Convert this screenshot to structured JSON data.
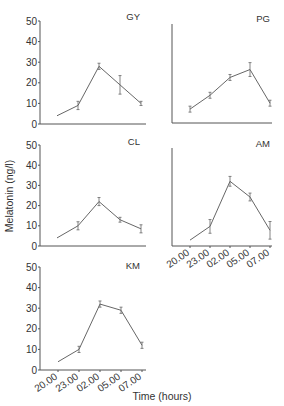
{
  "chart_data": [
    {
      "type": "line",
      "title": "GY",
      "xlabel": "",
      "ylabel": "",
      "categories": [
        "20.00",
        "23.00",
        "02.00",
        "05.00",
        "07.00"
      ],
      "values": [
        4,
        9,
        28,
        19,
        10
      ],
      "errors": [
        0,
        2,
        1.5,
        4.5,
        1
      ],
      "ylim": [
        0,
        50
      ],
      "yticks": [
        0,
        10,
        20,
        30,
        40,
        50
      ],
      "show_yticks": true,
      "show_xticks": false
    },
    {
      "type": "line",
      "title": "PG",
      "xlabel": "",
      "ylabel": "",
      "categories": [
        "20.00",
        "23.00",
        "02.00",
        "05.00",
        "07.00"
      ],
      "values": [
        7,
        14,
        23,
        27,
        10
      ],
      "errors": [
        1.5,
        1.5,
        1.5,
        3.5,
        1.5
      ],
      "ylim": [
        0,
        50
      ],
      "yticks": [],
      "show_yticks": false,
      "show_xticks": false
    },
    {
      "type": "line",
      "title": "CL",
      "xlabel": "",
      "ylabel": "Melatonin (ng/l)",
      "categories": [
        "20.00",
        "23.00",
        "02.00",
        "05.00",
        "07.00"
      ],
      "values": [
        4,
        10,
        22,
        13,
        8.5
      ],
      "errors": [
        0,
        2,
        2,
        1.2,
        2
      ],
      "ylim": [
        0,
        50
      ],
      "yticks": [
        0,
        10,
        20,
        30,
        40,
        50
      ],
      "show_yticks": true,
      "show_xticks": false
    },
    {
      "type": "line",
      "title": "AM",
      "xlabel": "",
      "ylabel": "",
      "categories": [
        "20.00",
        "23.00",
        "02.00",
        "05.00",
        "07.00"
      ],
      "values": [
        3,
        10,
        33,
        25,
        8
      ],
      "errors": [
        0,
        3.5,
        2.5,
        2,
        4.5
      ],
      "ylim": [
        0,
        50
      ],
      "yticks": [],
      "show_yticks": false,
      "show_xticks": true
    },
    {
      "type": "line",
      "title": "KM",
      "xlabel": "Time (hours)",
      "ylabel": "",
      "categories": [
        "20.00",
        "23.00",
        "02.00",
        "05.00",
        "07.00"
      ],
      "values": [
        4,
        10,
        32,
        29,
        12
      ],
      "errors": [
        0,
        1.5,
        1.5,
        1.5,
        1.5
      ],
      "ylim": [
        0,
        50
      ],
      "yticks": [
        0,
        10,
        20,
        30,
        40,
        50
      ],
      "show_yticks": true,
      "show_xticks": true
    }
  ],
  "figure": {
    "ylabel": "Melatonin (ng/l)",
    "xlabel": "Time (hours)"
  }
}
